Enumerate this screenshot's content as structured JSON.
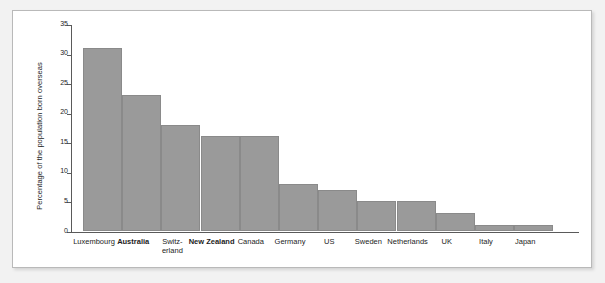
{
  "chart_data": {
    "type": "bar",
    "title": "",
    "subtitle": "",
    "xlabel": "",
    "ylabel": "Percentage of the population born overseas",
    "ylim": [
      0,
      35
    ],
    "yticks": [
      0,
      5,
      10,
      15,
      20,
      25,
      30,
      35
    ],
    "grid": false,
    "legend": null,
    "bar_color": "#9a9a9a",
    "bar_edge_color": "#8a8a8a",
    "background_color": "#ffffff",
    "page_background_color": "#f2f2f2",
    "categories": [
      "Luxembourg",
      "Australia",
      "Switz-\nerland",
      "New Zealand",
      "Canada",
      "Germany",
      "US",
      "Sweden",
      "Netherlands",
      "UK",
      "Italy",
      "Japan"
    ],
    "values": [
      31,
      23,
      18,
      16,
      16,
      8,
      7,
      5,
      5,
      3,
      1,
      1
    ],
    "bold_categories": [
      "Australia",
      "New Zealand"
    ],
    "annotations": []
  },
  "bars": [
    {
      "label": "Luxembourg",
      "label_line1": "Luxembourg",
      "label_line2": "",
      "value": 31,
      "bold": false
    },
    {
      "label": "Australia",
      "label_line1": "Australia",
      "label_line2": "",
      "value": 23,
      "bold": true
    },
    {
      "label": "Switzerland",
      "label_line1": "Switz-",
      "label_line2": "erland",
      "value": 18,
      "bold": false
    },
    {
      "label": "New Zealand",
      "label_line1": "New Zealand",
      "label_line2": "",
      "value": 16,
      "bold": true
    },
    {
      "label": "Canada",
      "label_line1": "Canada",
      "label_line2": "",
      "value": 16,
      "bold": false
    },
    {
      "label": "Germany",
      "label_line1": "Germany",
      "label_line2": "",
      "value": 8,
      "bold": false
    },
    {
      "label": "US",
      "label_line1": "US",
      "label_line2": "",
      "value": 7,
      "bold": false
    },
    {
      "label": "Sweden",
      "label_line1": "Sweden",
      "label_line2": "",
      "value": 5,
      "bold": false
    },
    {
      "label": "Netherlands",
      "label_line1": "Netherlands",
      "label_line2": "",
      "value": 5,
      "bold": false
    },
    {
      "label": "UK",
      "label_line1": "UK",
      "label_line2": "",
      "value": 3,
      "bold": false
    },
    {
      "label": "Italy",
      "label_line1": "Italy",
      "label_line2": "",
      "value": 1,
      "bold": false
    },
    {
      "label": "Japan",
      "label_line1": "Japan",
      "label_line2": "",
      "value": 1,
      "bold": false
    }
  ],
  "yticks": [
    {
      "value": 35,
      "label": "35"
    },
    {
      "value": 30,
      "label": "30"
    },
    {
      "value": 25,
      "label": "25"
    },
    {
      "value": 20,
      "label": "20"
    },
    {
      "value": 15,
      "label": "15"
    },
    {
      "value": 10,
      "label": "10"
    },
    {
      "value": 5,
      "label": "5"
    },
    {
      "value": 0,
      "label": "0"
    }
  ],
  "axis": {
    "y_title": "Percentage of the population born overseas"
  }
}
